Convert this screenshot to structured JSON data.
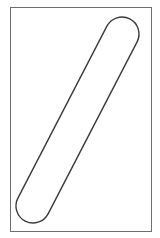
{
  "canvas": {
    "width": 160,
    "height": 238,
    "background_color": "#ffffff"
  },
  "figure": {
    "frame": {
      "x": 10,
      "y": 7,
      "width": 142,
      "height": 225,
      "border_color": "#6e6e6e",
      "border_width": 1,
      "fill_color": "#ffffff"
    },
    "capsule": {
      "start": {
        "x": 33,
        "y": 206
      },
      "end": {
        "x": 122,
        "y": 34
      },
      "radius": 17,
      "stroke_color": "#3a3a3a",
      "stroke_width": 1.4,
      "fill_color": "#ffffff"
    }
  }
}
